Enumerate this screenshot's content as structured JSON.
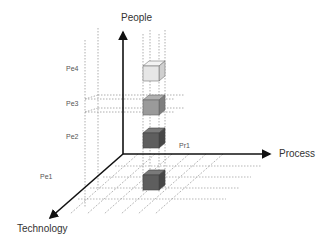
{
  "axes": {
    "people": "People",
    "process": "Process",
    "technology": "Technology"
  },
  "ticks": {
    "pe4": "Pe4",
    "pe3": "Pe3",
    "pe2": "Pe2",
    "pe1": "Pe1",
    "pr1": "Pr1"
  },
  "cubes": [
    {
      "level": "Pe4",
      "shade": "light",
      "color": "#e8e8e8"
    },
    {
      "level": "Pe3",
      "shade": "medium",
      "color": "#999999"
    },
    {
      "level": "Pe2",
      "shade": "dark",
      "color": "#5e5e5e"
    },
    {
      "level": "Pe1",
      "shade": "dark",
      "color": "#5e5e5e"
    }
  ],
  "colors": {
    "axis": "#111111",
    "grid": "#9a9a9a",
    "text": "#333333"
  }
}
